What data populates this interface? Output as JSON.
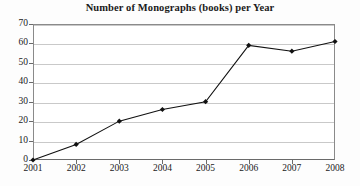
{
  "chart_data": {
    "type": "line",
    "title": "Number of Monographs (books) per Year",
    "xlabel": "",
    "ylabel": "",
    "categories": [
      "2001",
      "2002",
      "2003",
      "2004",
      "2005",
      "2006",
      "2007",
      "2008"
    ],
    "x": [
      2001,
      2002,
      2003,
      2004,
      2005,
      2006,
      2007,
      2008
    ],
    "values": [
      0,
      8,
      20,
      26,
      30,
      59,
      56,
      61
    ],
    "series": [
      {
        "name": "Monographs",
        "values": [
          0,
          8,
          20,
          26,
          30,
          59,
          56,
          61
        ]
      }
    ],
    "ylim": [
      0,
      70
    ],
    "yticks": [
      0,
      10,
      20,
      30,
      40,
      50,
      60,
      70
    ],
    "ytick_labels": [
      "0",
      "10",
      "20",
      "30",
      "40",
      "50",
      "60",
      "70"
    ],
    "xtick_labels": [
      "2001",
      "2002",
      "2003",
      "2004",
      "2005",
      "2006",
      "2007",
      "2008"
    ],
    "grid": true,
    "grid_axis": "y",
    "legend": false,
    "legend_position": "none",
    "marker": "diamond",
    "line_color": "#111111",
    "marker_color": "#111111",
    "grid_color": "#c9c9c9",
    "axis_color": "#6a6a6a",
    "background_color": "#ffffff"
  }
}
